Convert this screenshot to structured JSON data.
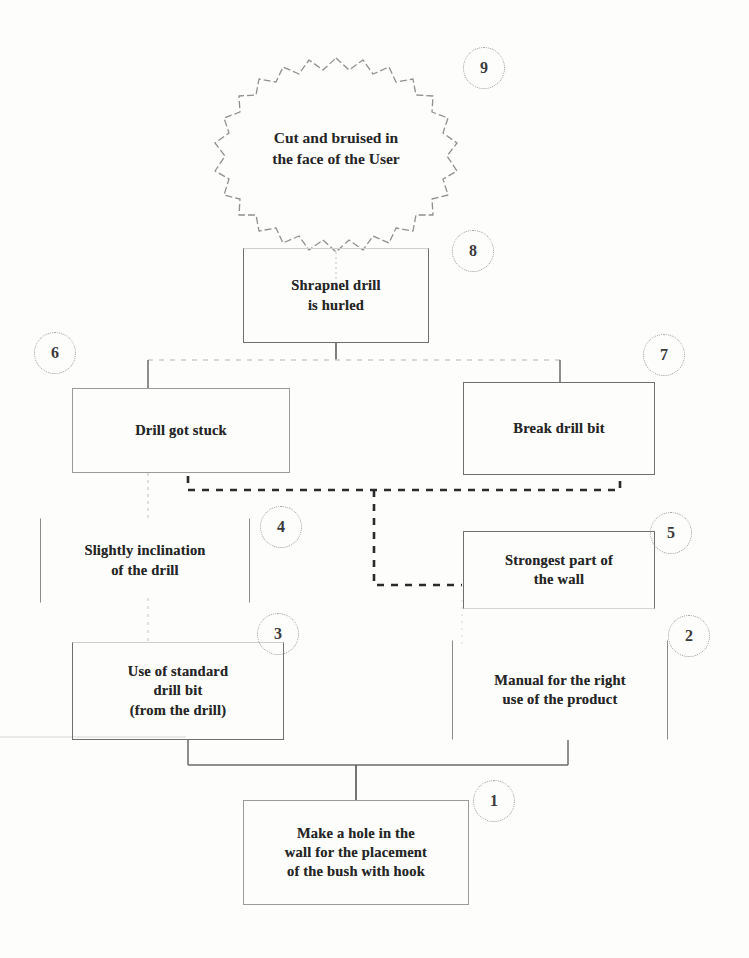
{
  "diagram": {
    "type": "fault-tree",
    "line_color": "#6f6f6f",
    "dashed_color": "#2f2f2f",
    "faint_color": "#c9c9c9",
    "text_color": "#262626",
    "background": "#fdfdfc"
  },
  "nodes": [
    {
      "id": "n1",
      "number": "1",
      "label": "Make a hole in the\nwall for the placement\nof the bush with hook",
      "shape": "rectangle",
      "level": "bottom"
    },
    {
      "id": "n2",
      "number": "2",
      "label": "Manual for the right\nuse of the product",
      "shape": "rectangle",
      "level": "lower-right"
    },
    {
      "id": "n3",
      "number": "3",
      "label": "Use of standard\ndrill bit\n(from the drill)",
      "shape": "rectangle",
      "level": "lower-left"
    },
    {
      "id": "n4",
      "number": "4",
      "label": "Slightly inclination\nof the drill",
      "shape": "rectangle",
      "level": "mid-left"
    },
    {
      "id": "n5",
      "number": "5",
      "label": "Strongest part of\nthe wall",
      "shape": "rectangle",
      "level": "mid-right"
    },
    {
      "id": "n6",
      "number": "6",
      "label": "Drill got stuck",
      "shape": "rectangle",
      "level": "upper-left"
    },
    {
      "id": "n7",
      "number": "7",
      "label": "Break drill bit",
      "shape": "rectangle",
      "level": "upper-right"
    },
    {
      "id": "n8",
      "number": "8",
      "label": "Shrapnel drill\nis hurled",
      "shape": "rectangle",
      "level": "top"
    },
    {
      "id": "n9",
      "number": "9",
      "label": "Cut and bruised in\nthe face of the User",
      "shape": "starburst",
      "level": "apex"
    }
  ],
  "badges": {
    "b1": "1",
    "b2": "2",
    "b3": "3",
    "b4": "4",
    "b5": "5",
    "b6": "6",
    "b7": "7",
    "b8": "8",
    "b9": "9"
  },
  "connections": [
    {
      "from": "n1",
      "to": "n3",
      "style": "solid"
    },
    {
      "from": "n1",
      "to": "n2",
      "style": "solid"
    },
    {
      "from": "n3",
      "to": "n4",
      "style": "faint"
    },
    {
      "from": "n4",
      "to": "n6",
      "style": "faint"
    },
    {
      "from": "n2",
      "to": "n5",
      "style": "faint"
    },
    {
      "from": "n5",
      "to": "n7",
      "style": "dashed"
    },
    {
      "from": "n6",
      "to": "n7",
      "style": "dashed"
    },
    {
      "from": "n6",
      "to": "n8",
      "style": "faint"
    },
    {
      "from": "n7",
      "to": "n8",
      "style": "faint"
    },
    {
      "from": "n8",
      "to": "n9",
      "style": "faint"
    }
  ]
}
